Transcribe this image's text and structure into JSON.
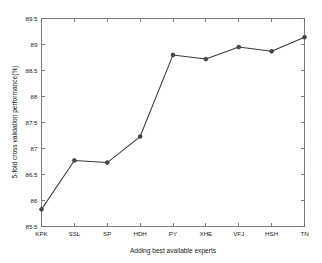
{
  "chart_data": {
    "type": "line",
    "title": "",
    "subtitle": "",
    "xlabel": "Adding best available experts",
    "ylabel": "5-fold cross validation performance(%)",
    "categories": [
      "KPK",
      "SSL",
      "SP",
      "HDH",
      "PY",
      "XHE",
      "VFJ",
      "HSH",
      "TN"
    ],
    "values": [
      85.83,
      86.77,
      86.73,
      87.23,
      88.8,
      88.72,
      88.95,
      88.87,
      89.14
    ],
    "series": [
      {
        "name": "5-fold cross validation performance(%)",
        "values": [
          85.83,
          86.77,
          86.73,
          87.23,
          88.8,
          88.72,
          88.95,
          88.87,
          89.14
        ]
      }
    ],
    "ylim": [
      85.5,
      89.5
    ],
    "yticks": [
      85.5,
      86,
      86.5,
      87,
      87.5,
      88,
      88.5,
      89,
      89.5
    ],
    "ytick_labels": [
      "85.5",
      "86",
      "86.5",
      "87",
      "87.5",
      "88",
      "88.5",
      "89",
      "89.5"
    ],
    "xtick_labels": [
      "KPK",
      "SSL",
      "SP",
      "HDH",
      "PY",
      "XHE",
      "VFJ",
      "HSH",
      "TN"
    ],
    "grid": false,
    "legend": false,
    "legend_position": "none",
    "marker": "circle",
    "line_color": "#3b3b3b",
    "marker_color": "#4a4a4a",
    "axis_color": "#6e6e6e",
    "background_color": "#ffffff"
  },
  "figure": {
    "xlabel": "Adding best available experts",
    "ylabel": "5-fold cross validation performance(%)"
  }
}
